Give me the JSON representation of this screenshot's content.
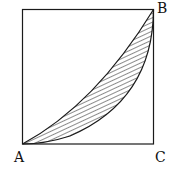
{
  "diagram": {
    "type": "geometry",
    "shape": "square",
    "labels": {
      "A": "A",
      "B": "B",
      "C": "C"
    },
    "shaded_region": "lens between arc/curve from A to B and the upper curve from A to B",
    "colors": {
      "stroke": "#1a1a1a",
      "background": "#ffffff"
    }
  }
}
